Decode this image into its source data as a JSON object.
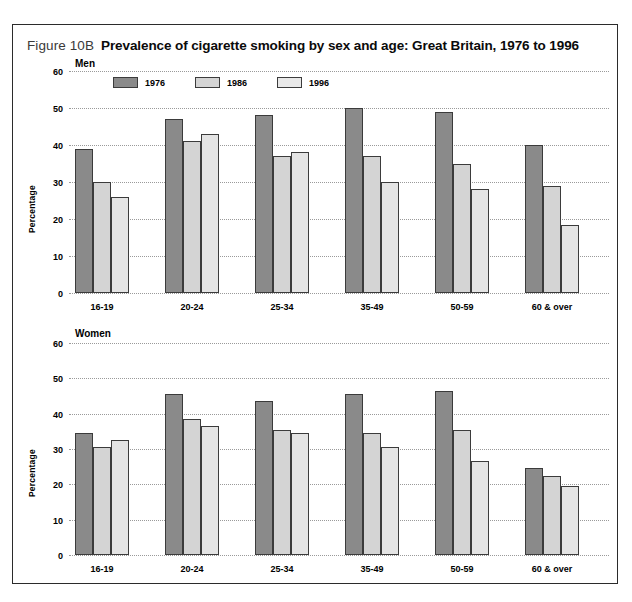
{
  "figure": {
    "number": "Figure 10B",
    "title": "Prevalence of cigarette smoking by sex and age: Great Britain, 1976 to 1996"
  },
  "legend": {
    "items": [
      {
        "label": "1976",
        "color": "#8a8a8a"
      },
      {
        "label": "1986",
        "color": "#d4d4d4"
      },
      {
        "label": "1996",
        "color": "#e8e8e8"
      }
    ]
  },
  "panels": [
    {
      "heading": "Men",
      "ylabel": "Percentage"
    },
    {
      "heading": "Women",
      "ylabel": "Percentage"
    }
  ],
  "yticks": [
    "60",
    "50",
    "40",
    "30",
    "20",
    "10",
    "0"
  ],
  "chart_data": [
    {
      "type": "bar",
      "title": "Men",
      "xlabel": "",
      "ylabel": "Percentage",
      "ylim": [
        0,
        60
      ],
      "yticks": [
        0,
        10,
        20,
        30,
        40,
        50,
        60
      ],
      "grid": true,
      "legend_position": "top-left",
      "categories": [
        "16-19",
        "20-24",
        "25-34",
        "35-49",
        "50-59",
        "60 & over"
      ],
      "series": [
        {
          "name": "1976",
          "values": [
            39,
            47,
            48,
            50,
            49,
            40
          ]
        },
        {
          "name": "1986",
          "values": [
            30,
            41,
            37,
            37,
            35,
            29
          ]
        },
        {
          "name": "1996",
          "values": [
            26,
            43,
            38,
            30,
            28,
            18.5
          ]
        }
      ]
    },
    {
      "type": "bar",
      "title": "Women",
      "xlabel": "",
      "ylabel": "Percentage",
      "ylim": [
        0,
        60
      ],
      "yticks": [
        0,
        10,
        20,
        30,
        40,
        50,
        60
      ],
      "grid": true,
      "legend_position": "top-left",
      "categories": [
        "16-19",
        "20-24",
        "25-34",
        "35-49",
        "50-59",
        "60 & over"
      ],
      "series": [
        {
          "name": "1976",
          "values": [
            34.5,
            45.5,
            43.5,
            45.5,
            46.5,
            24.5
          ]
        },
        {
          "name": "1986",
          "values": [
            30.5,
            38.5,
            35.5,
            34.5,
            35.5,
            22.5
          ]
        },
        {
          "name": "1996",
          "values": [
            32.5,
            36.5,
            34.5,
            30.5,
            26.5,
            19.5
          ]
        }
      ]
    }
  ]
}
